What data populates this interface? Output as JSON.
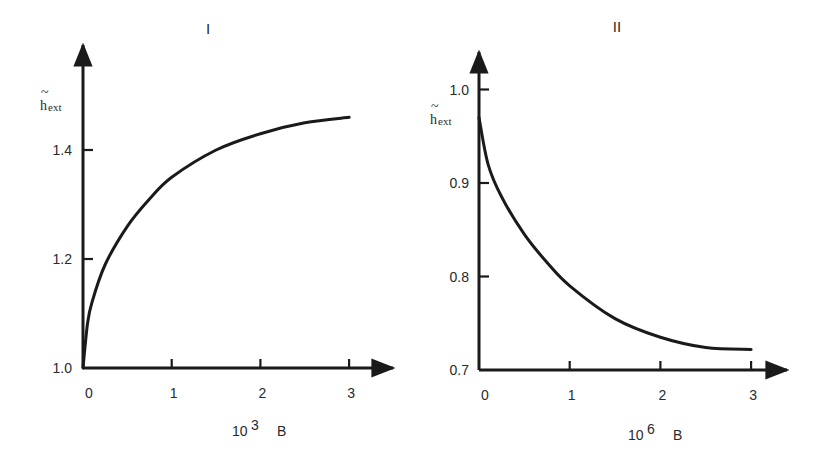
{
  "chart_data": [
    {
      "type": "line",
      "title": "I",
      "xlabel": "10^3 B",
      "xlabel_base": "10",
      "xlabel_exp": "3",
      "xlabel_var": "B",
      "ylabel": "h̃_ext",
      "ylabel_main": "h",
      "ylabel_sub": "ext",
      "xticks": [
        "0",
        "1",
        "2",
        "3"
      ],
      "yticks": [
        "1.0",
        "1.2",
        "1.4"
      ],
      "xlim": [
        0,
        3.4
      ],
      "ylim": [
        1.0,
        1.6
      ],
      "grid": false,
      "series": [
        {
          "name": "h_ext",
          "x": [
            0,
            0.05,
            0.1,
            0.25,
            0.5,
            0.75,
            1.0,
            1.5,
            2.0,
            2.5,
            3.0
          ],
          "y": [
            1.0,
            1.08,
            1.12,
            1.19,
            1.26,
            1.31,
            1.35,
            1.4,
            1.43,
            1.45,
            1.46
          ]
        }
      ]
    },
    {
      "type": "line",
      "title": "II",
      "xlabel": "10^6 B",
      "xlabel_base": "10",
      "xlabel_exp": "6",
      "xlabel_var": "B",
      "ylabel": "h̃_ext",
      "ylabel_main": "h",
      "ylabel_sub": "ext",
      "xticks": [
        "0",
        "1",
        "2",
        "3"
      ],
      "yticks": [
        "0.7",
        "0.8",
        "0.9",
        "1.0"
      ],
      "xlim": [
        0,
        3.3
      ],
      "ylim": [
        0.7,
        1.03
      ],
      "grid": false,
      "series": [
        {
          "name": "h_ext",
          "x": [
            0,
            0.1,
            0.25,
            0.5,
            0.75,
            1.0,
            1.5,
            2.0,
            2.5,
            3.0
          ],
          "y": [
            0.97,
            0.92,
            0.885,
            0.845,
            0.815,
            0.79,
            0.755,
            0.735,
            0.724,
            0.722
          ]
        }
      ]
    }
  ]
}
